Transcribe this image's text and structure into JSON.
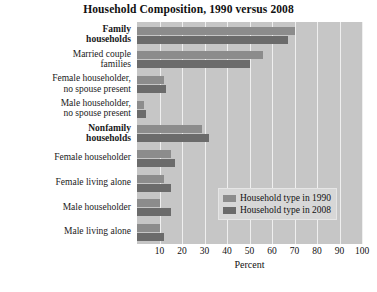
{
  "chart_data": {
    "type": "bar",
    "orientation": "horizontal",
    "title": "Household Composition, 1990 versus 2008",
    "xlabel": "Percent",
    "ylabel": "",
    "xlim": [
      0,
      100
    ],
    "xticks": [
      10,
      20,
      30,
      40,
      50,
      60,
      70,
      80,
      90,
      100
    ],
    "grid": true,
    "legend_position": "center-right-inside",
    "categories": [
      "Family households",
      "Married couple families",
      "Female householder, no spouse present",
      "Male householder, no spouse present",
      "Nonfamily households",
      "Female householder",
      "Female living alone",
      "Male householder",
      "Male living alone"
    ],
    "category_lines": [
      [
        "Family",
        "households"
      ],
      [
        "Married couple",
        "families"
      ],
      [
        "Female householder,",
        "no spouse present"
      ],
      [
        "Male householder,",
        "no spouse present"
      ],
      [
        "Nonfamily",
        "households"
      ],
      [
        "Female householder"
      ],
      [
        "Female living alone"
      ],
      [
        "Male householder"
      ],
      [
        "Male living alone"
      ]
    ],
    "category_bold": [
      true,
      false,
      false,
      false,
      true,
      false,
      false,
      false,
      false
    ],
    "series": [
      {
        "name": "Household type in 1990",
        "color": "#8c8c8c",
        "values": [
          70,
          56,
          12,
          3,
          29,
          15,
          12,
          10,
          10
        ]
      },
      {
        "name": "Household type in 2008",
        "color": "#6b6b6b",
        "values": [
          67,
          50,
          13,
          4,
          32,
          17,
          15,
          15,
          12
        ]
      }
    ],
    "plot_background": "#c6c6c6",
    "gridline_color": "#efefef"
  },
  "legend": {
    "entries": [
      {
        "label": "Household type in 1990",
        "color": "#8c8c8c"
      },
      {
        "label": "Household type in 2008",
        "color": "#6b6b6b"
      }
    ]
  }
}
